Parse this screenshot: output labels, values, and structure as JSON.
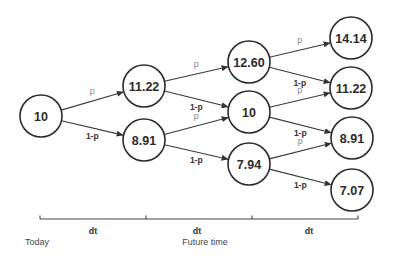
{
  "diagram": {
    "type": "binomial-tree",
    "nodes": [
      {
        "id": "n0",
        "label": "10",
        "step": 0,
        "cx": 41,
        "cy": 116
      },
      {
        "id": "n1u",
        "label": "11.22",
        "step": 1,
        "cx": 144,
        "cy": 86
      },
      {
        "id": "n1d",
        "label": "8.91",
        "step": 1,
        "cx": 144,
        "cy": 140
      },
      {
        "id": "n2u",
        "label": "12.60",
        "step": 2,
        "cx": 249,
        "cy": 62
      },
      {
        "id": "n2m",
        "label": "10",
        "step": 2,
        "cx": 249,
        "cy": 112
      },
      {
        "id": "n2d",
        "label": "7.94",
        "step": 2,
        "cx": 249,
        "cy": 164
      },
      {
        "id": "n3a",
        "label": "14.14",
        "step": 3,
        "cx": 351,
        "cy": 38
      },
      {
        "id": "n3b",
        "label": "11.22",
        "step": 3,
        "cx": 351,
        "cy": 88
      },
      {
        "id": "n3c",
        "label": "8.91",
        "step": 3,
        "cx": 352,
        "cy": 138
      },
      {
        "id": "n3d",
        "label": "7.07",
        "step": 3,
        "cx": 352,
        "cy": 190
      }
    ],
    "edges": [
      {
        "from": "n0",
        "to": "n1u",
        "label": "p"
      },
      {
        "from": "n0",
        "to": "n1d",
        "label": "1-p"
      },
      {
        "from": "n1u",
        "to": "n2u",
        "label": "p"
      },
      {
        "from": "n1u",
        "to": "n2m",
        "label": "1-p"
      },
      {
        "from": "n1d",
        "to": "n2m",
        "label": "p"
      },
      {
        "from": "n1d",
        "to": "n2d",
        "label": "1-p"
      },
      {
        "from": "n2u",
        "to": "n3a",
        "label": "p"
      },
      {
        "from": "n2u",
        "to": "n3b",
        "label": "1-p"
      },
      {
        "from": "n2m",
        "to": "n3b",
        "label": "p"
      },
      {
        "from": "n2m",
        "to": "n3c",
        "label": "1-p"
      },
      {
        "from": "n2d",
        "to": "n3c",
        "label": "p"
      },
      {
        "from": "n2d",
        "to": "n3d",
        "label": "1-p"
      }
    ],
    "node_radius": 21
  },
  "timeline": {
    "intervals": [
      "dt",
      "dt",
      "dt"
    ],
    "start_label": "Today",
    "axis_label": "Future time",
    "x_start": 40,
    "x_end": 358,
    "y": 219,
    "ticks": [
      40,
      146,
      252,
      358
    ]
  },
  "colors": {
    "stroke": "#2b2b2b",
    "p_label": "#8a8a8a",
    "q_label": "#333333"
  }
}
